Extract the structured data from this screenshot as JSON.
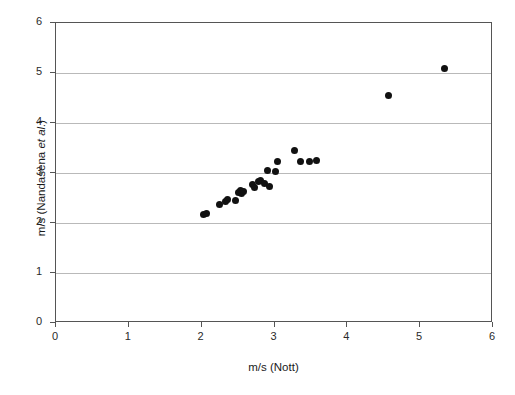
{
  "chart_data": {
    "type": "scatter",
    "title": "",
    "xlabel": "m/s (Nott)",
    "ylabel_parts": {
      "prefix": "m/s (Nandasena ",
      "italic": "et al.",
      "suffix": ")"
    },
    "ylabel": "m/s (Nandasena et al.)",
    "xlim": [
      0,
      6
    ],
    "ylim": [
      0,
      6
    ],
    "xticks": [
      0,
      1,
      2,
      3,
      4,
      5,
      6
    ],
    "yticks": [
      0,
      1,
      2,
      3,
      4,
      5,
      6
    ],
    "xtick_labels": [
      "0",
      "1",
      "2",
      "3",
      "4",
      "5",
      "6"
    ],
    "ytick_labels": [
      "0",
      "1",
      "2",
      "3",
      "4",
      "5",
      "6"
    ],
    "grid": "horizontal",
    "legend": "none",
    "marker": "filled-circle",
    "marker_color": "#111111",
    "grid_color": "#b9b9b9",
    "frame_color": "#555555",
    "points": [
      {
        "x": 2.02,
        "y": 2.17
      },
      {
        "x": 2.07,
        "y": 2.2
      },
      {
        "x": 2.24,
        "y": 2.37
      },
      {
        "x": 2.33,
        "y": 2.44
      },
      {
        "x": 2.36,
        "y": 2.47
      },
      {
        "x": 2.46,
        "y": 2.45
      },
      {
        "x": 2.51,
        "y": 2.62
      },
      {
        "x": 2.53,
        "y": 2.66
      },
      {
        "x": 2.55,
        "y": 2.6
      },
      {
        "x": 2.57,
        "y": 2.63
      },
      {
        "x": 2.7,
        "y": 2.78
      },
      {
        "x": 2.73,
        "y": 2.72
      },
      {
        "x": 2.78,
        "y": 2.84
      },
      {
        "x": 2.81,
        "y": 2.85
      },
      {
        "x": 2.86,
        "y": 2.79
      },
      {
        "x": 2.9,
        "y": 3.06
      },
      {
        "x": 2.93,
        "y": 2.74
      },
      {
        "x": 3.01,
        "y": 3.04
      },
      {
        "x": 3.04,
        "y": 3.24
      },
      {
        "x": 3.27,
        "y": 3.45
      },
      {
        "x": 3.36,
        "y": 3.23
      },
      {
        "x": 3.48,
        "y": 3.23
      },
      {
        "x": 3.57,
        "y": 3.25
      },
      {
        "x": 4.57,
        "y": 4.55
      },
      {
        "x": 5.33,
        "y": 5.09
      }
    ]
  }
}
